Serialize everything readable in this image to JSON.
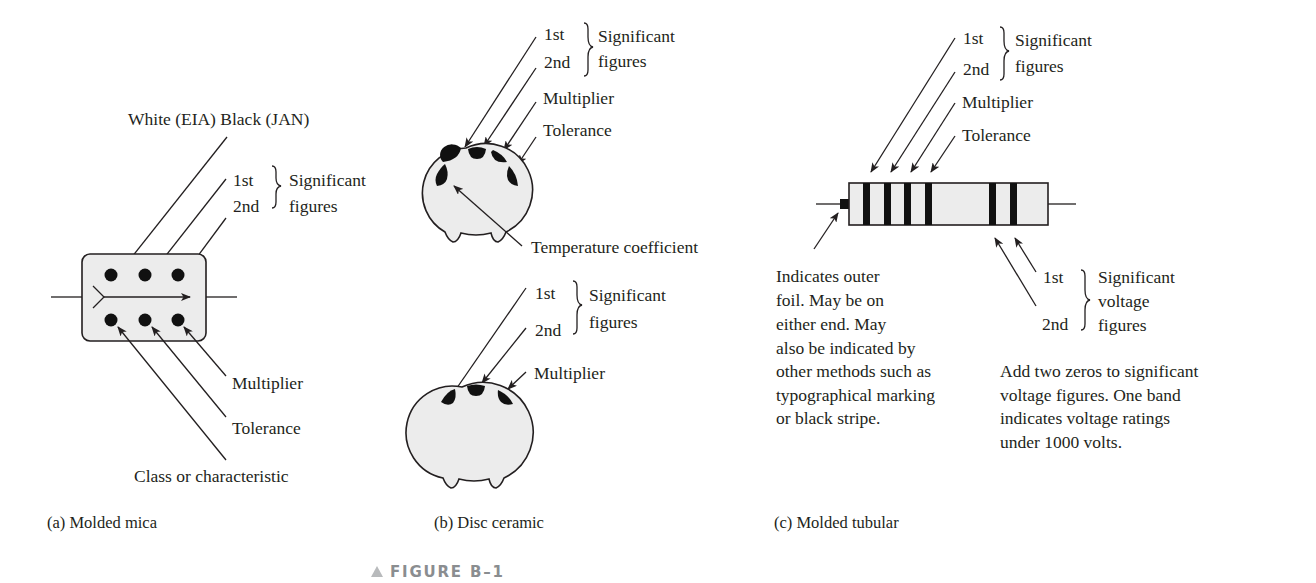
{
  "figure": {
    "label": "FIGURE B–1",
    "marker_icon": "triangle-up-icon",
    "marker_color": "#b8babc"
  },
  "colors": {
    "ink": "#231f20",
    "body_fill": "#ececec",
    "marking": "#111111",
    "figure_label": "#8a8d90"
  },
  "panel_a": {
    "caption": "(a) Molded mica",
    "top_label": "White (EIA) Black (JAN)",
    "first": "1st",
    "second": "2nd",
    "group_line1": "Significant",
    "group_line2": "figures",
    "multiplier": "Multiplier",
    "tolerance": "Tolerance",
    "class": "Class or characteristic"
  },
  "panel_b": {
    "caption": "(b) Disc ceramic",
    "upper": {
      "first": "1st",
      "second": "2nd",
      "group_line1": "Significant",
      "group_line2": "figures",
      "multiplier": "Multiplier",
      "tolerance": "Tolerance",
      "temp_coeff": "Temperature coefficient"
    },
    "lower": {
      "first": "1st",
      "second": "2nd",
      "group_line1": "Significant",
      "group_line2": "figures",
      "multiplier": "Multiplier"
    }
  },
  "panel_c": {
    "caption": "(c) Molded tubular",
    "first": "1st",
    "second": "2nd",
    "group_line1": "Significant",
    "group_line2": "figures",
    "multiplier": "Multiplier",
    "tolerance": "Tolerance",
    "foil_note": [
      "Indicates outer",
      "foil.  May be on",
      "either end.  May",
      "also be indicated by",
      "other methods such as",
      "typographical marking",
      "or black stripe."
    ],
    "voltage": {
      "first": "1st",
      "second": "2nd",
      "group_line1": "Significant",
      "group_line2": "voltage",
      "group_line3": "figures"
    },
    "voltage_note": [
      "Add two zeros to significant",
      "voltage figures.  One band",
      "indicates voltage ratings",
      "under 1000 volts."
    ]
  }
}
